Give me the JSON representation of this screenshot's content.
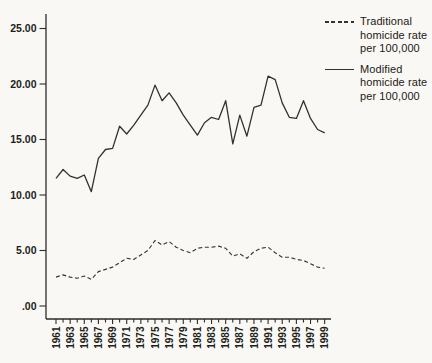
{
  "colors": {
    "line": "#35322d",
    "axis": "#2f2c28",
    "text": "#211e1b",
    "background": "#f9f8f4"
  },
  "legend": {
    "items": [
      {
        "swatch": "dashed-line",
        "label": "Traditional\nhomicide rate\nper 100,000"
      },
      {
        "swatch": "solid-line",
        "label": "Modified\nhomicide rate\nper 100,000"
      }
    ]
  },
  "chart_data": {
    "type": "line",
    "title": "",
    "xlabel": "",
    "ylabel": "",
    "grid": false,
    "legend_position": "top-right",
    "ylim": [
      0,
      26.3
    ],
    "y_tick_values": [
      25,
      20,
      15,
      10,
      5,
      0
    ],
    "y_tick_labels": [
      "25.00",
      "20.00",
      "15.00",
      "10.00",
      "5.00",
      ".00"
    ],
    "x_years": [
      1961,
      1962,
      1963,
      1964,
      1965,
      1966,
      1967,
      1968,
      1969,
      1970,
      1971,
      1972,
      1973,
      1974,
      1975,
      1976,
      1977,
      1978,
      1979,
      1980,
      1981,
      1982,
      1983,
      1984,
      1985,
      1986,
      1987,
      1988,
      1989,
      1990,
      1991,
      1992,
      1993,
      1994,
      1995,
      1996,
      1997,
      1998,
      1999
    ],
    "x_labeled_years": [
      "1961",
      "1963",
      "1965",
      "1967",
      "1969",
      "1971",
      "1973",
      "1975",
      "1977",
      "1979",
      "1981",
      "1983",
      "1985",
      "1987",
      "1989",
      "1991",
      "1993",
      "1995",
      "1997",
      "1999"
    ],
    "series": [
      {
        "name": "Traditional homicide rate per 100,000",
        "style": "dashed",
        "color": "#3a3733",
        "values": [
          2.6,
          2.8,
          2.6,
          2.5,
          2.7,
          2.4,
          3.1,
          3.3,
          3.5,
          3.9,
          4.3,
          4.2,
          4.6,
          5.0,
          5.9,
          5.5,
          5.8,
          5.3,
          5.0,
          4.8,
          5.2,
          5.3,
          5.3,
          5.4,
          5.2,
          4.5,
          4.7,
          4.3,
          4.9,
          5.2,
          5.3,
          4.8,
          4.4,
          4.4,
          4.2,
          4.1,
          3.8,
          3.5,
          3.4
        ]
      },
      {
        "name": "Modified homicide rate per 100,000",
        "style": "solid",
        "color": "#34312d",
        "values": [
          11.5,
          12.3,
          11.7,
          11.5,
          11.8,
          10.3,
          13.3,
          14.1,
          14.2,
          16.2,
          15.5,
          16.3,
          17.2,
          18.1,
          19.9,
          18.5,
          19.2,
          18.3,
          17.2,
          16.3,
          15.4,
          16.5,
          17.0,
          16.8,
          18.5,
          14.6,
          17.2,
          15.3,
          17.9,
          18.1,
          20.7,
          20.4,
          18.3,
          17.0,
          16.9,
          18.5,
          16.9,
          15.9,
          15.6
        ]
      }
    ]
  }
}
